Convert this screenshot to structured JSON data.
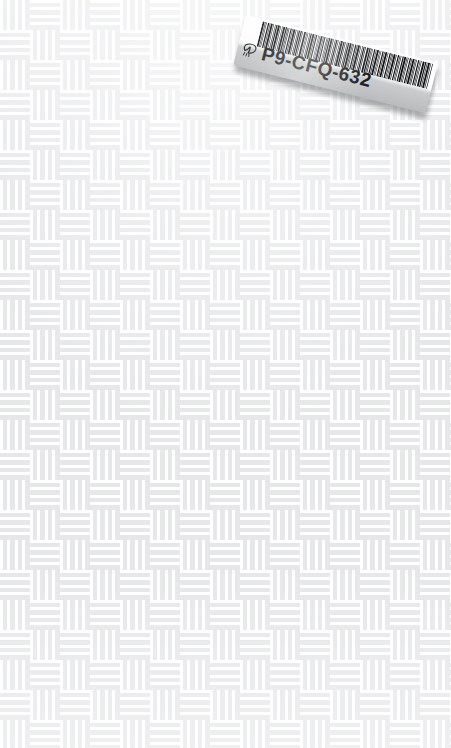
{
  "scene": {
    "width": 451,
    "height": 748,
    "background_label": "woven-basket-weave-surface",
    "background_base_color": "#e5e7e8",
    "background_stripe_color": "#ffffff"
  },
  "label": {
    "code": "P9-CFQ-632",
    "glyph_name": "leaf-glyph",
    "paper_color": "#ffffff",
    "ink_color": "#17191b",
    "shadow_color": "#46484a",
    "rotation_degrees": 14,
    "barcode": {
      "name": "code39-barcode",
      "bar_color": "#111315",
      "bar_widths": [
        3,
        1,
        1,
        2,
        1,
        3,
        1,
        1,
        2,
        3,
        1,
        1,
        3,
        2,
        1,
        1,
        2,
        1,
        3,
        1,
        1,
        2,
        2,
        1,
        3,
        1,
        1,
        1,
        2,
        3,
        1,
        2,
        1,
        1,
        3,
        1,
        2,
        1,
        1,
        2,
        3,
        1,
        1,
        2,
        1,
        1,
        3,
        2,
        1,
        1,
        2,
        3,
        1,
        1,
        2,
        1,
        3,
        1,
        1,
        2,
        1,
        3,
        2,
        1,
        1,
        2,
        1,
        3,
        1,
        1,
        2,
        1,
        3,
        1,
        2,
        1,
        1,
        3,
        1,
        2,
        1,
        1,
        2,
        3,
        1,
        1,
        2,
        1,
        3,
        1,
        1,
        2,
        1,
        1,
        3,
        2,
        1,
        3,
        1,
        1
      ],
      "gap_widths": [
        1,
        1,
        2,
        1,
        1,
        1,
        2,
        1,
        1,
        1,
        2,
        1,
        1,
        1,
        1,
        2,
        1,
        1,
        1,
        2,
        1,
        1,
        1,
        2,
        1,
        1,
        2,
        1,
        1,
        1,
        1,
        2,
        1,
        1,
        1,
        1,
        2,
        1,
        1,
        1,
        1,
        2,
        1,
        1,
        2,
        1,
        1,
        1,
        2,
        1,
        1,
        1,
        1,
        2,
        1,
        1,
        1,
        2,
        1,
        1,
        2,
        1,
        1,
        1,
        2,
        1,
        1,
        1,
        1,
        2,
        1,
        1,
        1,
        2,
        1,
        1,
        1,
        1,
        2,
        1,
        1,
        2,
        1,
        1,
        1,
        2,
        1,
        1,
        1,
        1,
        2,
        1,
        1,
        2,
        1,
        1,
        1,
        1,
        2,
        1
      ]
    }
  }
}
